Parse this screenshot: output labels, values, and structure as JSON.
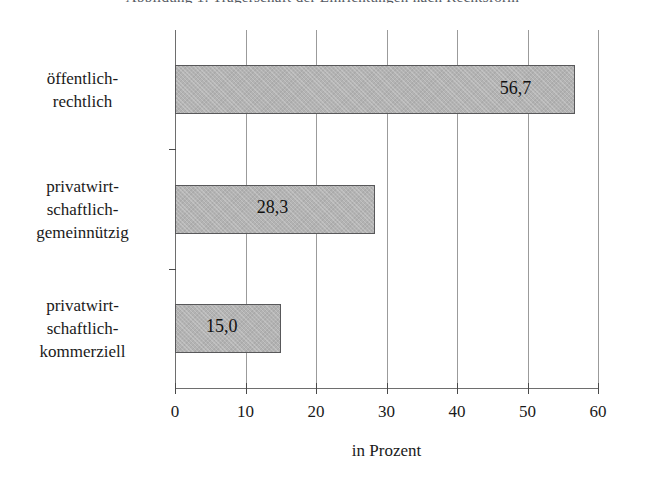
{
  "figure": {
    "caption_remnant": "Abbildung 1: Trägerschaft der Einrichtungen nach Rechtsform"
  },
  "chart_data": {
    "type": "bar",
    "orientation": "horizontal",
    "title": "",
    "subtitle": "",
    "categories": [
      "öffentlich-rechtlich",
      "privatwirtschaftlich-gemeinnützig",
      "privatwirtschaftlich-kommerziell"
    ],
    "category_lines": [
      [
        "öffentlich-",
        "rechtlich"
      ],
      [
        "privatwirt-",
        "schaftlich-",
        "gemeinnützig"
      ],
      [
        "privatwirt-",
        "schaftlich-",
        "kommerziell"
      ]
    ],
    "values": [
      56.7,
      28.3,
      15.0
    ],
    "value_labels": [
      "56,7",
      "28,3",
      "15,0"
    ],
    "xlabel": "in Prozent",
    "ylabel": "",
    "xlim": [
      0,
      60
    ],
    "xticks": [
      0,
      10,
      20,
      30,
      40,
      50,
      60
    ],
    "xticklabels": [
      "0",
      "10",
      "20",
      "30",
      "40",
      "50",
      "60"
    ],
    "grid": true,
    "grid_axis": "x",
    "legend": false,
    "bar_fill_color": "#b3b3b3",
    "bar_border_color": "#58585a",
    "axis_color": "#6e6e6e",
    "gridline_color": "#9b9b9b",
    "text_color": "#1a1a1a",
    "background_color": "#ffffff"
  }
}
